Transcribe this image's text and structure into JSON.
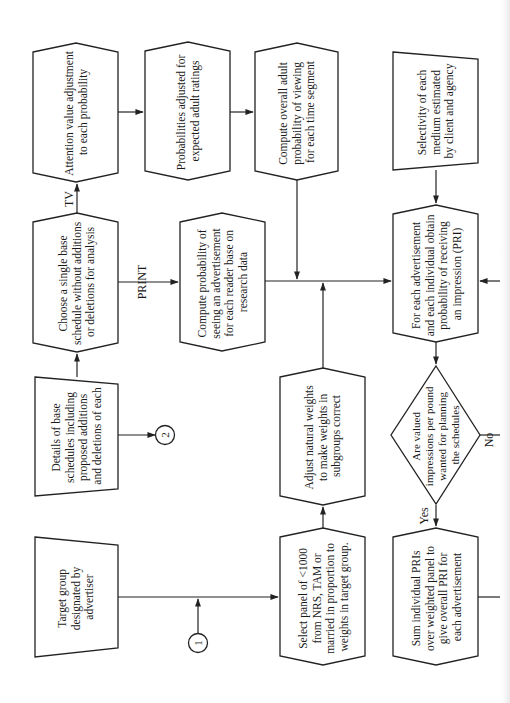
{
  "diagram": {
    "orientation": "rotated-90-ccw",
    "colors": {
      "stroke": "#222222",
      "background": "#ffffff",
      "text": "#1a1a1a"
    },
    "nodes": [
      {
        "id": "attention",
        "shape": "hexagon",
        "lines": [
          "Attention value adjustment",
          "to each probability"
        ]
      },
      {
        "id": "probabilities",
        "shape": "hexagon",
        "lines": [
          "Probabilities adjusted for",
          "expected adult ratings"
        ]
      },
      {
        "id": "overall_adult",
        "shape": "hexagon",
        "lines": [
          "Compute overall adult",
          "probability of viewing",
          "for each time segment"
        ]
      },
      {
        "id": "selectivity",
        "shape": "input-trapezoid",
        "lines": [
          "Selectivity of each",
          "medium estimated",
          "by client and agency"
        ]
      },
      {
        "id": "choose_schedule",
        "shape": "hexagon",
        "lines": [
          "Choose a single base",
          "schedule without additions",
          "or deletions for analysis"
        ]
      },
      {
        "id": "compute_seeing",
        "shape": "hexagon",
        "lines": [
          "Compute probability of",
          "seeing an advertisement",
          "for each reader base on",
          "research data"
        ]
      },
      {
        "id": "obtain_pri",
        "shape": "hexagon",
        "lines": [
          "For each advertisement",
          "and each individual obtain",
          "probability of receiving",
          "an impression (PRI)"
        ]
      },
      {
        "id": "details",
        "shape": "input-trapezoid",
        "lines": [
          "Details of base",
          "schedules including",
          "proposed additions",
          "and deletions of each"
        ]
      },
      {
        "id": "adjust_weights",
        "shape": "hexagon",
        "lines": [
          "Adjust natural weights",
          "to make weights in",
          "subgroups correct"
        ]
      },
      {
        "id": "decision",
        "shape": "diamond",
        "lines": [
          "Are valued",
          "impressions per pound",
          "wanted for planning",
          "the schedules"
        ]
      },
      {
        "id": "target_group",
        "shape": "input-trapezoid",
        "lines": [
          "Target group",
          "designated by",
          "advertiser"
        ]
      },
      {
        "id": "select_panel",
        "shape": "hexagon",
        "lines": [
          "Select panel of <1000",
          "from NRS, TAM or",
          "married in proportion to",
          "weights in target group."
        ]
      },
      {
        "id": "sum_pri",
        "shape": "hexagon",
        "lines": [
          "Sum individual PRIs",
          "over weighted panel to",
          "give overall PRI for",
          "each advertisement"
        ]
      }
    ],
    "edge_labels": {
      "tv": "TV",
      "print": "PRINT",
      "yes": "Yes",
      "no": "No"
    },
    "connectors": [
      {
        "id": "connector-1",
        "label": "1"
      },
      {
        "id": "connector-2",
        "label": "2"
      }
    ]
  }
}
